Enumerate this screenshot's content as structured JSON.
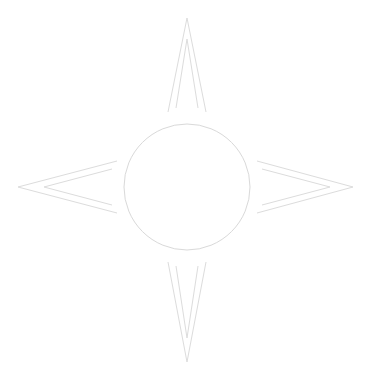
{
  "figure": {
    "background_color": "#ffffff",
    "stroke_color": "#dcdcdc",
    "circle_stroke_color": "#d9d9d9",
    "stroke_width": 1,
    "canvas": {
      "width": 369,
      "height": 380
    },
    "circle": {
      "cx": 187,
      "cy": 187,
      "r": 63
    },
    "arrows": [
      {
        "name": "north-arrow",
        "direction": "up",
        "outer_points": "168,112 187,18 206,112",
        "inner_points": "176,108 187,39 198,108"
      },
      {
        "name": "east-arrow",
        "direction": "right",
        "outer_points": "257,161 353,187 257,213",
        "inner_points": "262,169 330,187 262,205"
      },
      {
        "name": "south-arrow",
        "direction": "down",
        "outer_points": "168,262 187,362 206,262",
        "inner_points": "176,266 187,338 198,266"
      },
      {
        "name": "west-arrow",
        "direction": "left",
        "outer_points": "117,161 18,187 117,213",
        "inner_points": "112,169 44,187 112,205"
      }
    ]
  }
}
